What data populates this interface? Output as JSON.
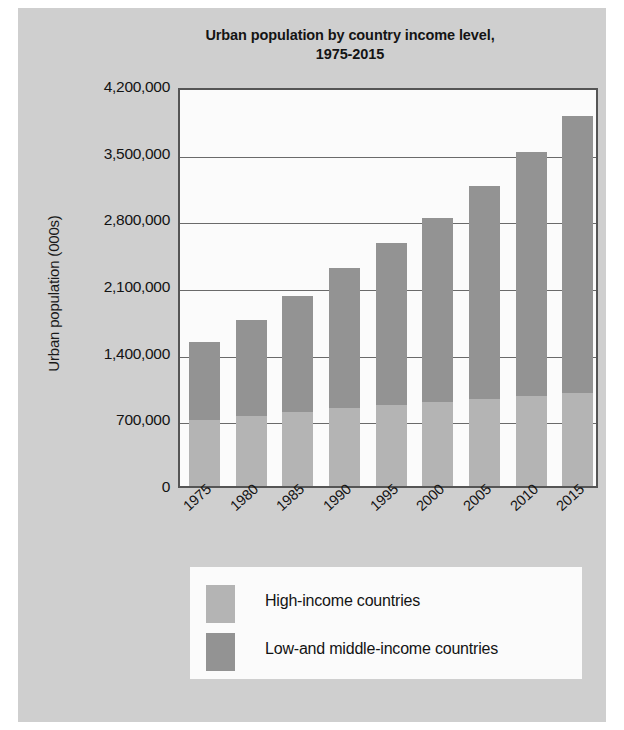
{
  "chart_data": {
    "type": "bar",
    "stacked": true,
    "title": "Urban population by country income level, 1975-2015",
    "title_line1": "Urban population by country income level,",
    "title_line2": "1975-2015",
    "xlabel": "",
    "ylabel": "Urban population (000s)",
    "categories": [
      "1975",
      "1980",
      "1985",
      "1990",
      "1995",
      "2000",
      "2005",
      "2010",
      "2015"
    ],
    "series": [
      {
        "name": "High-income countries",
        "color": "#b4b4b4",
        "values": [
          690000,
          735000,
          780000,
          815000,
          850000,
          880000,
          910000,
          945000,
          980000
        ]
      },
      {
        "name": "Low-and middle-income countries",
        "color": "#939393",
        "values": [
          820000,
          1005000,
          1215000,
          1475000,
          1700000,
          1930000,
          2240000,
          2565000,
          2910000
        ]
      }
    ],
    "totals": [
      1510000,
      1740000,
      1995000,
      2290000,
      2550000,
      2810000,
      3150000,
      3510000,
      3890000
    ],
    "yticks": [
      "0",
      "700,000",
      "1,400,000",
      "2,100,000",
      "2,800,000",
      "3,500,000",
      "4,200,000"
    ],
    "ytick_values": [
      0,
      700000,
      1400000,
      2100000,
      2800000,
      3500000,
      4200000
    ],
    "ylim": [
      0,
      4200000
    ],
    "grid": true,
    "legend_position": "bottom"
  },
  "legend": {
    "items": [
      {
        "label": "High-income countries",
        "color": "#b4b4b4"
      },
      {
        "label": "Low-and middle-income countries",
        "color": "#939393"
      }
    ]
  }
}
